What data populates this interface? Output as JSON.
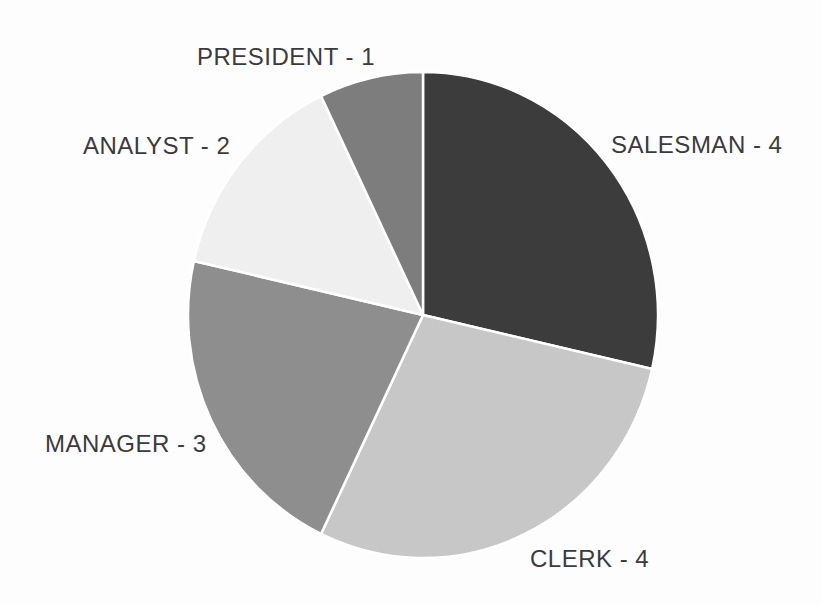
{
  "chart_data": {
    "type": "pie",
    "title": "",
    "categories": [
      "SALESMAN",
      "CLERK",
      "MANAGER",
      "ANALYST",
      "PRESIDENT"
    ],
    "values": [
      4,
      4,
      3,
      2,
      1
    ],
    "total": 14,
    "labels": [
      "SALESMAN - 4",
      "CLERK - 4",
      "MANAGER - 3",
      "ANALYST - 2",
      "PRESIDENT - 1"
    ],
    "colors": [
      "#3c3c3c",
      "#c7c7c7",
      "#8e8e8e",
      "#efefef",
      "#7d7d7d"
    ],
    "separator_color": "#ffffff",
    "label_color": "#3b3b3b",
    "background_color": "#fdfdfd",
    "start_angle_deg_from_12_oclock": 0,
    "direction": "clockwise",
    "legend_position": "none",
    "grid": false
  }
}
